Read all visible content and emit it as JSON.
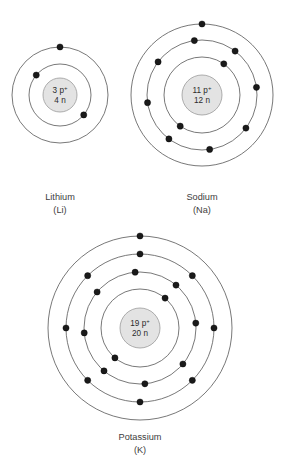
{
  "figure": {
    "kind": "bohr-atomic-model-diagram",
    "background_color": "#ffffff",
    "ring_color": "#555555",
    "electron_color": "#1a1a1a",
    "nucleus_fill": "#e3e3e3",
    "nucleus_stroke": "#9a9a9a",
    "text_color": "#3d3d3d"
  },
  "atoms": [
    {
      "id": "lithium",
      "name": "Lithium",
      "symbol": "(Li)",
      "protons": "3 p",
      "proton_charge": "+",
      "neutrons": "4 n",
      "nucleus_line1": "3 p+",
      "nucleus_line2": "4 n",
      "center_x": 60,
      "center_y": 95,
      "nucleus_radius": 17,
      "shell_radii": [
        31,
        48
      ],
      "shell_electron_counts": [
        2,
        1
      ],
      "total_electrons": 3,
      "label_x": 60,
      "label_y": 200,
      "label_y2": 213
    },
    {
      "id": "sodium",
      "name": "Sodium",
      "symbol": "(Na)",
      "protons": "11 p",
      "proton_charge": "+",
      "neutrons": "12 n",
      "nucleus_line1": "11 p+",
      "nucleus_line2": "12 n",
      "center_x": 202,
      "center_y": 95,
      "nucleus_radius": 20,
      "shell_radii": [
        38,
        55,
        71
      ],
      "shell_electron_counts": [
        2,
        8,
        1
      ],
      "total_electrons": 11,
      "label_x": 202,
      "label_y": 200,
      "label_y2": 213
    },
    {
      "id": "potassium",
      "name": "Potassium",
      "symbol": "(K)",
      "protons": "19 p",
      "proton_charge": "+",
      "neutrons": "20 n",
      "nucleus_line1": "19 p+",
      "nucleus_line2": "20 n",
      "center_x": 140,
      "center_y": 328,
      "nucleus_radius": 20,
      "shell_radii": [
        39,
        56,
        74,
        92
      ],
      "shell_electron_counts": [
        2,
        8,
        8,
        1
      ],
      "total_electrons": 19,
      "label_x": 140,
      "label_y": 440,
      "label_y2": 453
    }
  ],
  "electron_positions": {
    "lithium": [
      [
        -58,
        155
      ],
      [
        50,
        248
      ],
      [
        68,
        -68
      ]
    ],
    "sodium": [
      [
        36,
        128
      ],
      [
        215,
        65
      ],
      [
        8,
        8
      ],
      [
        60,
        52
      ],
      [
        100,
        92
      ],
      [
        133,
        128
      ],
      [
        170,
        168
      ],
      [
        218,
        212
      ],
      [
        252,
        250
      ],
      [
        285,
        292
      ],
      [
        318,
        330
      ],
      [
        75,
        330
      ]
    ],
    "potassium": [
      [
        52,
        132
      ],
      [
        232,
        62
      ],
      [
        10,
        10
      ],
      [
        45,
        40
      ],
      [
        80,
        78
      ],
      [
        120,
        110
      ],
      [
        158,
        150
      ],
      [
        190,
        190
      ],
      [
        225,
        228
      ],
      [
        262,
        262
      ],
      [
        298,
        300
      ],
      [
        335,
        338
      ],
      [
        70,
        50
      ]
    ]
  }
}
